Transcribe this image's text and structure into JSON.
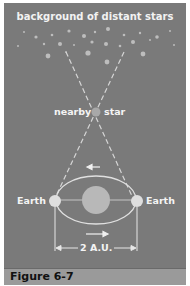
{
  "diagram": {
    "title": "background of distant stars",
    "nearby_star_label_left": "nearby",
    "nearby_star_label_right": "star",
    "earth_left_label": "Earth",
    "earth_right_label": "Earth",
    "distance_label": "2 A.U.",
    "caption": "Figure 6-7"
  },
  "colors": {
    "background": "#7a7a7a",
    "caption_bar": "#9a9a9a",
    "text": "#f4f4f4",
    "stars": "#bdbdbd",
    "sun": "#b8b8b8",
    "earth": "#dedede"
  }
}
